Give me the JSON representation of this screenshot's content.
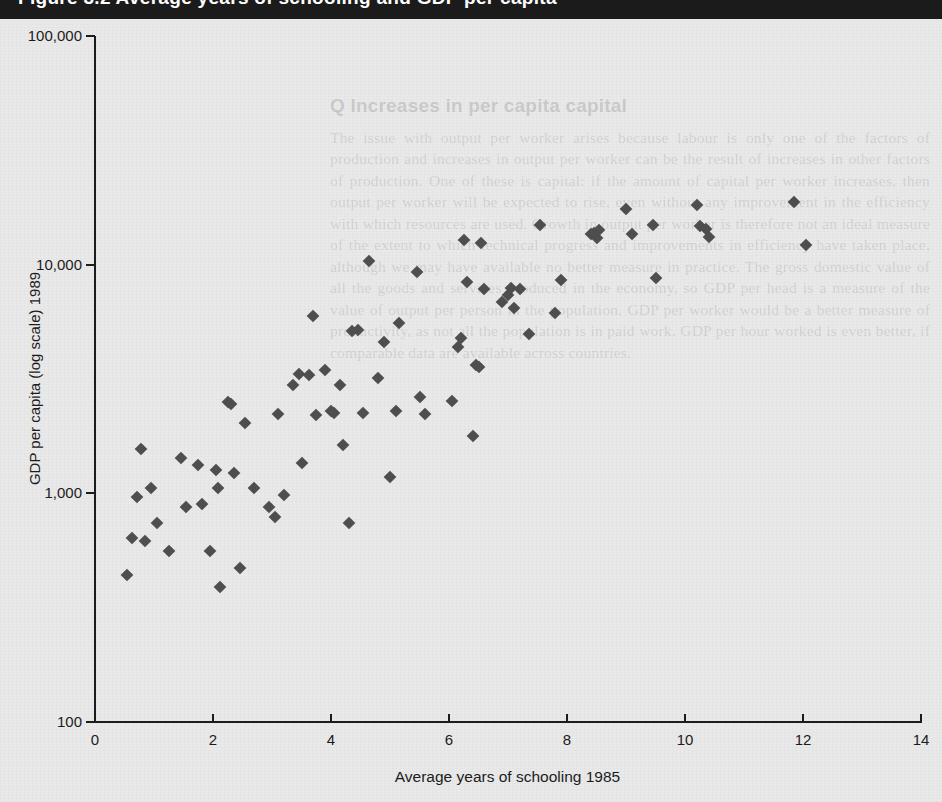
{
  "banner": {
    "text": "Figure 3.2 Average years of schooling and GDP per capita"
  },
  "bleed_text": {
    "heading": "Q Increases in per capita capital",
    "body": "The issue with output per worker arises because labour is only one of the factors of production and increases in output per worker can be the result of increases in other factors of production. One of these is capital: if the amount of capital per worker increases, then output per worker will be expected to rise, even without any improvement in the efficiency with which resources are used. Growth in output per worker is therefore not an ideal measure of the extent to which technical progress and improvements in efficiency have taken place, although we may have available no better measure in practice. The gross domestic value of all the goods and services produced in the economy, so GDP per head is a measure of the value of output per person in the population. GDP per worker would be a better measure of productivity, as not all the population is in paid work. GDP per hour worked is even better, if comparable data are available across countries."
  },
  "chart_data": {
    "type": "scatter",
    "title": "",
    "xlabel": "Average years of schooling 1985",
    "ylabel": "GDP per capita (log scale) 1989",
    "xlim": [
      0,
      14
    ],
    "ylim": [
      100,
      100000
    ],
    "yscale": "log",
    "xticks": [
      0,
      2,
      4,
      6,
      8,
      10,
      12,
      14
    ],
    "xticklabels": [
      "0",
      "2",
      "4",
      "6",
      "8",
      "10",
      "12",
      "14"
    ],
    "yticks": [
      100,
      1000,
      10000,
      100000
    ],
    "yticklabels": [
      "100",
      "1,000",
      "10,000",
      "100,000"
    ],
    "grid": false,
    "legend": false,
    "marker": "diamond",
    "marker_color": "#4e4e4e",
    "marker_size_px": 9,
    "points": [
      [
        0.55,
        440
      ],
      [
        0.62,
        640
      ],
      [
        0.72,
        960
      ],
      [
        0.78,
        1560
      ],
      [
        0.85,
        620
      ],
      [
        0.95,
        1060
      ],
      [
        1.05,
        740
      ],
      [
        1.25,
        560
      ],
      [
        1.45,
        1430
      ],
      [
        1.55,
        870
      ],
      [
        1.75,
        1330
      ],
      [
        1.82,
        900
      ],
      [
        1.95,
        560
      ],
      [
        2.05,
        1260
      ],
      [
        2.08,
        1050
      ],
      [
        2.12,
        390
      ],
      [
        2.25,
        2520
      ],
      [
        2.3,
        2470
      ],
      [
        2.35,
        1230
      ],
      [
        2.45,
        470
      ],
      [
        2.55,
        2040
      ],
      [
        2.7,
        1060
      ],
      [
        2.95,
        870
      ],
      [
        3.05,
        790
      ],
      [
        3.1,
        2220
      ],
      [
        3.2,
        980
      ],
      [
        3.35,
        2980
      ],
      [
        3.45,
        3320
      ],
      [
        3.5,
        1360
      ],
      [
        3.62,
        3280
      ],
      [
        3.7,
        5970
      ],
      [
        3.75,
        2210
      ],
      [
        3.9,
        3470
      ],
      [
        4.0,
        2280
      ],
      [
        4.05,
        2240
      ],
      [
        4.15,
        2980
      ],
      [
        4.2,
        1620
      ],
      [
        4.3,
        740
      ],
      [
        4.35,
        5150
      ],
      [
        4.45,
        5200
      ],
      [
        4.55,
        2250
      ],
      [
        4.65,
        10400
      ],
      [
        4.8,
        3200
      ],
      [
        4.9,
        4600
      ],
      [
        5.0,
        1180
      ],
      [
        5.1,
        2280
      ],
      [
        5.15,
        5560
      ],
      [
        5.45,
        9300
      ],
      [
        5.5,
        2640
      ],
      [
        5.6,
        2230
      ],
      [
        6.05,
        2540
      ],
      [
        6.15,
        4380
      ],
      [
        6.2,
        4780
      ],
      [
        6.25,
        12800
      ],
      [
        6.3,
        8400
      ],
      [
        6.4,
        1790
      ],
      [
        6.45,
        3650
      ],
      [
        6.5,
        3580
      ],
      [
        6.55,
        12500
      ],
      [
        6.6,
        7800
      ],
      [
        6.9,
        6900
      ],
      [
        7.0,
        7350
      ],
      [
        7.05,
        7900
      ],
      [
        7.1,
        6450
      ],
      [
        7.2,
        7850
      ],
      [
        7.35,
        5000
      ],
      [
        7.55,
        14900
      ],
      [
        7.8,
        6150
      ],
      [
        7.9,
        8600
      ],
      [
        8.4,
        13600
      ],
      [
        8.45,
        13700
      ],
      [
        8.5,
        13100
      ],
      [
        8.55,
        14200
      ],
      [
        9.0,
        17600
      ],
      [
        9.1,
        13600
      ],
      [
        9.45,
        14900
      ],
      [
        9.5,
        8700
      ],
      [
        10.2,
        18300
      ],
      [
        10.25,
        14800
      ],
      [
        10.35,
        14300
      ],
      [
        10.4,
        13200
      ],
      [
        11.85,
        18800
      ],
      [
        12.05,
        12200
      ]
    ]
  }
}
